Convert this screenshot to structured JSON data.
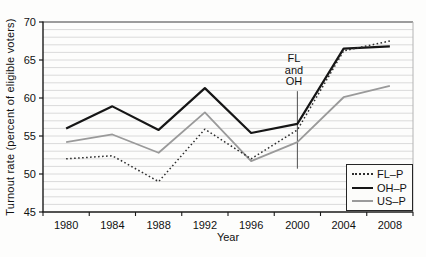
{
  "figure": {
    "background": "#fdfdfc"
  },
  "chart_data": {
    "type": "line",
    "title": "",
    "xlabel": "Year",
    "ylabel": "Turnout rate (percent of eligible voters)",
    "x": [
      1980,
      1984,
      1988,
      1992,
      1996,
      2000,
      2004,
      2008
    ],
    "ylim": [
      45,
      70
    ],
    "y_major_ticks": [
      45,
      50,
      55,
      60,
      65,
      70
    ],
    "y_minor_step": 1,
    "grid": "horizontal minor gridlines every 1 unit",
    "legend_position": "bottom-right",
    "series": [
      {
        "name": "FL–P",
        "style": "dotted",
        "color": "#2e2e2e",
        "values": [
          52.0,
          52.4,
          49.0,
          55.9,
          52.0,
          55.8,
          66.2,
          67.5
        ]
      },
      {
        "name": "OH–P",
        "style": "solid",
        "color": "#161616",
        "values": [
          56.0,
          58.9,
          55.8,
          61.3,
          55.4,
          56.6,
          66.5,
          66.8
        ]
      },
      {
        "name": "US–P",
        "style": "solid",
        "color": "#9a9a9a",
        "values": [
          54.2,
          55.2,
          52.8,
          58.1,
          51.7,
          54.2,
          60.1,
          61.6
        ]
      }
    ],
    "annotation": {
      "lines": [
        "FL",
        "and",
        "OH"
      ],
      "x": 2000,
      "line_value_top": 60.9,
      "line_value_bottom": 50.7
    }
  },
  "colors": {
    "axis": "#1a1a1a",
    "grid": "#dadada",
    "frame_top": "#3c3c3c",
    "frame_right": "#b4b4b4",
    "annotation_line": "#4f4f4f",
    "text": "#111111",
    "legend_border": "#262626",
    "legend_background": "#fcfcfa"
  }
}
